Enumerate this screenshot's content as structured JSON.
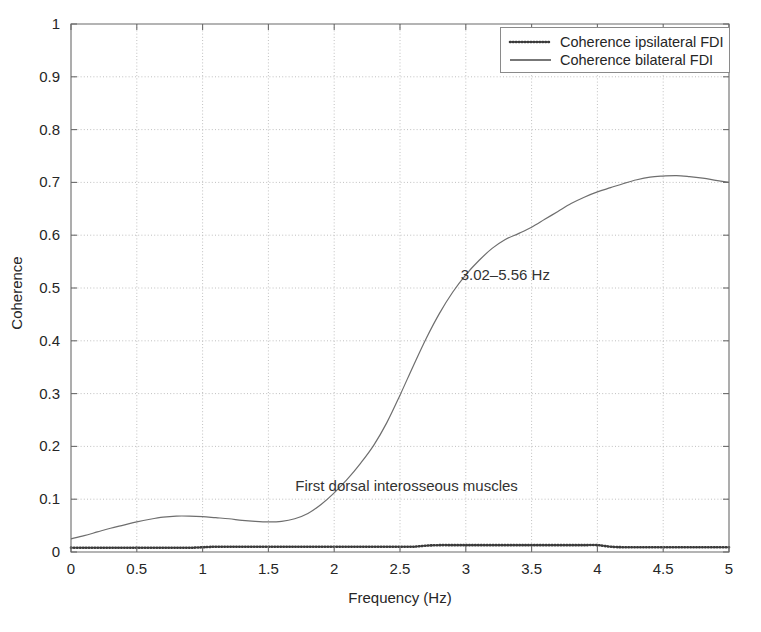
{
  "chart_data": {
    "type": "line",
    "title": "",
    "xlabel": "Frequency (Hz)",
    "ylabel": "Coherence",
    "xlim": [
      0,
      5
    ],
    "ylim": [
      0,
      1
    ],
    "grid": true,
    "legend_position": "top-right",
    "xticks": [
      "0",
      "0.5",
      "1",
      "1.5",
      "2",
      "2.5",
      "3",
      "3.5",
      "4",
      "4.5",
      "5"
    ],
    "xtick_values": [
      0,
      0.5,
      1,
      1.5,
      2,
      2.5,
      3,
      3.5,
      4,
      4.5,
      5
    ],
    "yticks": [
      "0",
      "0.1",
      "0.2",
      "0.3",
      "0.4",
      "0.5",
      "0.6",
      "0.7",
      "0.8",
      "0.9",
      "1"
    ],
    "ytick_values": [
      0,
      0.1,
      0.2,
      0.3,
      0.4,
      0.5,
      0.6,
      0.7,
      0.8,
      0.9,
      1
    ],
    "x": [
      0,
      0.1,
      0.2,
      0.3,
      0.4,
      0.5,
      0.6,
      0.7,
      0.8,
      0.9,
      1.0,
      1.1,
      1.2,
      1.3,
      1.4,
      1.5,
      1.6,
      1.7,
      1.8,
      1.9,
      2.0,
      2.1,
      2.2,
      2.3,
      2.4,
      2.5,
      2.6,
      2.7,
      2.8,
      2.9,
      3.0,
      3.1,
      3.2,
      3.3,
      3.4,
      3.5,
      3.6,
      3.7,
      3.8,
      3.9,
      4.0,
      4.1,
      4.2,
      4.3,
      4.4,
      4.5,
      4.6,
      4.7,
      4.8,
      4.9,
      5.0
    ],
    "series": [
      {
        "name": "Coherence ipsilateral FDI",
        "style": "dotted",
        "color": "#3a3a3a",
        "values": [
          0.025,
          0.031,
          0.038,
          0.045,
          0.051,
          0.057,
          0.062,
          0.066,
          0.068,
          0.068,
          0.067,
          0.065,
          0.063,
          0.06,
          0.058,
          0.057,
          0.058,
          0.063,
          0.073,
          0.09,
          0.112,
          0.138,
          0.168,
          0.202,
          0.245,
          0.297,
          0.352,
          0.405,
          0.452,
          0.492,
          0.525,
          0.552,
          0.575,
          0.592,
          0.603,
          0.615,
          0.63,
          0.645,
          0.66,
          0.672,
          0.682,
          0.69,
          0.698,
          0.705,
          0.71,
          0.712,
          0.713,
          0.711,
          0.708,
          0.704,
          0.7
        ]
      },
      {
        "name": "Coherence bilateral FDI",
        "style": "solid",
        "color": "#6e6e6e",
        "values": [
          0.008,
          0.008,
          0.008,
          0.008,
          0.008,
          0.008,
          0.008,
          0.008,
          0.008,
          0.008,
          0.009,
          0.01,
          0.01,
          0.01,
          0.01,
          0.01,
          0.01,
          0.01,
          0.01,
          0.01,
          0.01,
          0.01,
          0.01,
          0.01,
          0.01,
          0.01,
          0.01,
          0.012,
          0.013,
          0.013,
          0.013,
          0.013,
          0.013,
          0.013,
          0.013,
          0.013,
          0.013,
          0.013,
          0.013,
          0.013,
          0.013,
          0.01,
          0.009,
          0.009,
          0.009,
          0.009,
          0.009,
          0.009,
          0.009,
          0.009,
          0.009
        ]
      }
    ],
    "annotations": [
      {
        "text": "3.02–5.56 Hz",
        "x": 3.3,
        "y": 0.515
      },
      {
        "text": "First dorsal interosseous muscles",
        "x": 2.55,
        "y": 0.115
      }
    ]
  },
  "legend": {
    "entries": [
      {
        "label": "Coherence ipsilateral FDI"
      },
      {
        "label": "Coherence bilateral FDI"
      }
    ]
  }
}
